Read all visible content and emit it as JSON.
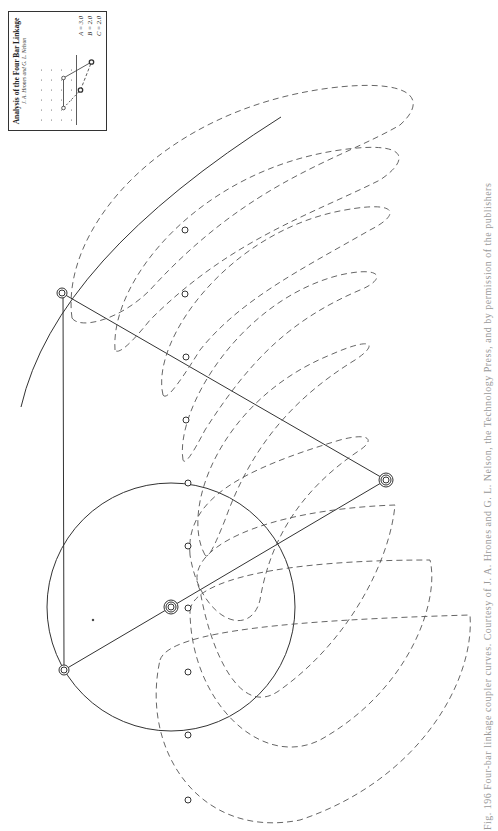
{
  "inset": {
    "title": "Analysis of the Four Bar Linkage",
    "authors": "J. A. Hrones and G. L. Nelson",
    "params": [
      {
        "label": "A",
        "value": "3.0"
      },
      {
        "label": "B",
        "value": "2.0"
      },
      {
        "label": "C",
        "value": "2.0"
      }
    ],
    "param_lines": [
      "A = 3.0",
      "B = 2.0",
      "C = 2.0"
    ],
    "diagram_labels": [
      "A",
      "B",
      "C"
    ]
  },
  "caption": "Fig. 196  Four-bar linkage coupler curves. Courtesy of J. A. Hrones and G. L. Nelson, the Technology Press, and by permission of the publishers",
  "linkage": {
    "fixed_pivot_top": [
      62,
      293
    ],
    "fixed_pivot_bottom": [
      64,
      670
    ],
    "crank_pivot": [
      171,
      607
    ],
    "coupler_point": [
      386,
      480
    ],
    "crank_circle_radius": 124,
    "marker_points": [
      [
        185,
        230
      ],
      [
        185,
        294
      ],
      [
        186,
        357
      ],
      [
        186,
        420
      ],
      [
        188,
        483
      ],
      [
        188,
        546
      ],
      [
        188,
        608
      ],
      [
        188,
        672
      ],
      [
        188,
        735
      ],
      [
        188,
        800
      ]
    ],
    "loop_tips": [
      [
        419,
        85
      ],
      [
        404,
        143
      ],
      [
        392,
        200
      ],
      [
        374,
        256
      ],
      [
        374,
        317
      ],
      [
        375,
        377
      ],
      [
        376,
        444
      ],
      [
        395,
        507
      ],
      [
        430,
        565
      ],
      [
        470,
        622
      ]
    ]
  },
  "colors": {
    "line": "#333333",
    "dashed": "#555555",
    "caption": "#999999"
  }
}
